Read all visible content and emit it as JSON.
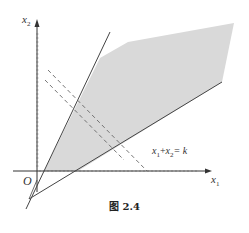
{
  "figure": {
    "caption": "图 2.4",
    "axes": {
      "x_label_var": "x",
      "x_label_sub": "1",
      "y_label_var": "x",
      "y_label_sub": "2",
      "origin_label": "O"
    },
    "level_line_label": {
      "a_var": "x",
      "a_sub": "1",
      "plus": "+",
      "b_var": "x",
      "b_sub": "2",
      "eq": "= k"
    },
    "colors": {
      "feasible_region": "#d9d9d9",
      "lines": "#444444",
      "dashed": "#666666"
    }
  }
}
